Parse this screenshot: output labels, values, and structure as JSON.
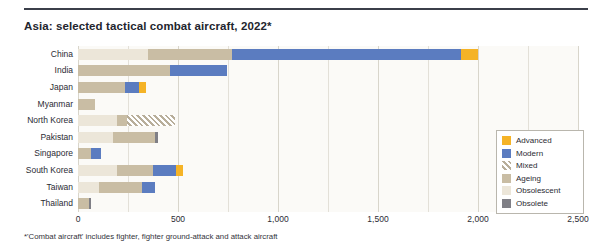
{
  "header": {
    "title": "Asia: selected tactical combat aircraft, 2022*"
  },
  "footnote": "*'Combat aircraft' includes fighter, fighter ground-attack and attack aircraft",
  "legend": {
    "position": "inside-right",
    "items": [
      {
        "label": "Advanced",
        "key": "advanced",
        "color": "#f5b326",
        "icon": "square-swatch-advanced"
      },
      {
        "label": "Modern",
        "key": "modern",
        "color": "#5b7cc0",
        "icon": "square-swatch-modern"
      },
      {
        "label": "Mixed",
        "key": "mixed",
        "color": "#b8ae9a",
        "icon": "hatched-swatch-mixed"
      },
      {
        "label": "Ageing",
        "key": "ageing",
        "color": "#c9bda4",
        "icon": "square-swatch-ageing"
      },
      {
        "label": "Obsolescent",
        "key": "obsolescent",
        "color": "#ece6d9",
        "icon": "square-swatch-obsolescent"
      },
      {
        "label": "Obsolete",
        "key": "obsolete",
        "color": "#7f7f86",
        "icon": "square-swatch-obsolete"
      }
    ]
  },
  "chart_data": {
    "type": "bar",
    "orientation": "horizontal",
    "stacked": true,
    "title": "Asia: selected tactical combat aircraft, 2022*",
    "xlabel": "",
    "ylabel": "",
    "xlim": [
      0,
      2500
    ],
    "xticks": [
      0,
      500,
      1000,
      1500,
      2000,
      2500
    ],
    "xticklabels": [
      "0",
      "500",
      "1,000",
      "1,500",
      "2,000",
      "2,500"
    ],
    "grid": true,
    "categories": [
      "China",
      "India",
      "Japan",
      "Myanmar",
      "North Korea",
      "Pakistan",
      "Singapore",
      "South Korea",
      "Taiwan",
      "Thailand"
    ],
    "series": [
      {
        "name": "Obsolescent",
        "key": "obsolescent",
        "color": "#ece6d9",
        "values": [
          350,
          0,
          0,
          0,
          195,
          175,
          0,
          195,
          105,
          0
        ]
      },
      {
        "name": "Ageing",
        "key": "ageing",
        "color": "#c9bda4",
        "values": [
          420,
          460,
          235,
          85,
          50,
          210,
          65,
          180,
          215,
          55
        ]
      },
      {
        "name": "Mixed",
        "key": "mixed",
        "color": "#b8ae9a",
        "values": [
          0,
          0,
          0,
          0,
          240,
          0,
          0,
          0,
          0,
          0
        ]
      },
      {
        "name": "Modern",
        "key": "modern",
        "color": "#5b7cc0",
        "values": [
          1145,
          285,
          70,
          0,
          0,
          0,
          50,
          115,
          65,
          0
        ]
      },
      {
        "name": "Advanced",
        "key": "advanced",
        "color": "#f5b326",
        "values": [
          85,
          0,
          35,
          0,
          0,
          0,
          0,
          35,
          0,
          0
        ]
      },
      {
        "name": "Obsolete",
        "key": "obsolete",
        "color": "#7f7f86",
        "values": [
          0,
          0,
          0,
          0,
          0,
          15,
          0,
          0,
          0,
          10
        ]
      }
    ],
    "stack_order": [
      "obsolescent",
      "ageing",
      "mixed",
      "modern",
      "advanced",
      "obsolete"
    ],
    "totals": [
      2000,
      745,
      340,
      85,
      485,
      400,
      115,
      525,
      385,
      65
    ]
  }
}
